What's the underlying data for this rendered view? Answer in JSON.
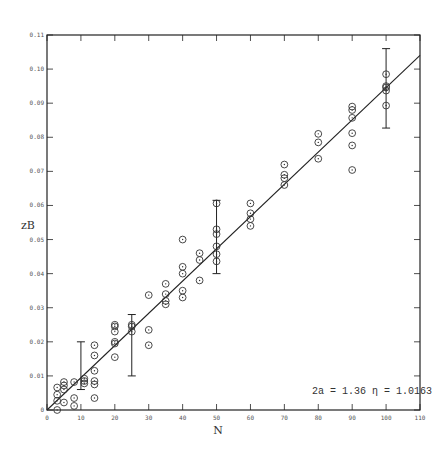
{
  "chart_data": {
    "type": "scatter",
    "title": "",
    "xlabel": "N",
    "ylabel": "zB",
    "xlim": [
      0,
      110
    ],
    "ylim": [
      0,
      0.11
    ],
    "grid": false,
    "xticks": [
      0,
      10,
      20,
      30,
      40,
      50,
      60,
      70,
      80,
      90,
      100,
      110
    ],
    "xtick_labels": [
      "0",
      "10",
      "20",
      "30",
      "40",
      "50",
      "60",
      "70",
      "80",
      "90",
      "100",
      "110"
    ],
    "yticks": [
      0,
      0.01,
      0.02,
      0.03,
      0.04,
      0.05,
      0.06,
      0.07,
      0.08,
      0.09,
      0.1,
      0.11
    ],
    "ytick_labels": [
      "0",
      "0.01",
      "0.02",
      "0.03",
      "0.04",
      "0.05",
      "0.06",
      "0.07",
      "0.08",
      "0.09",
      "0.10",
      "0.11"
    ],
    "annotation": "2a = 1.36    η = 1.0163",
    "series": [
      {
        "name": "measurements",
        "marker": "circle-dot",
        "points": [
          [
            3,
            0.0066
          ],
          [
            3,
            0.0045
          ],
          [
            3,
            0.0027
          ],
          [
            3,
            0.0
          ],
          [
            5,
            0.0082
          ],
          [
            5,
            0.0072
          ],
          [
            5,
            0.006
          ],
          [
            5,
            0.0022
          ],
          [
            8,
            0.0082
          ],
          [
            8,
            0.0035
          ],
          [
            8,
            0.0012
          ],
          [
            11,
            0.0092
          ],
          [
            11,
            0.0085
          ],
          [
            11,
            0.0078
          ],
          [
            14,
            0.019
          ],
          [
            14,
            0.016
          ],
          [
            14,
            0.0115
          ],
          [
            14,
            0.0085
          ],
          [
            14,
            0.0075
          ],
          [
            14,
            0.0035
          ],
          [
            20,
            0.025
          ],
          [
            20,
            0.0245
          ],
          [
            20,
            0.023
          ],
          [
            20,
            0.02
          ],
          [
            20,
            0.0195
          ],
          [
            20,
            0.0155
          ],
          [
            25,
            0.025
          ],
          [
            25,
            0.0245
          ],
          [
            25,
            0.023
          ],
          [
            30,
            0.0337
          ],
          [
            30,
            0.0235
          ],
          [
            30,
            0.019
          ],
          [
            35,
            0.037
          ],
          [
            35,
            0.034
          ],
          [
            35,
            0.032
          ],
          [
            35,
            0.031
          ],
          [
            40,
            0.05
          ],
          [
            40,
            0.042
          ],
          [
            40,
            0.04
          ],
          [
            40,
            0.035
          ],
          [
            40,
            0.033
          ],
          [
            45,
            0.046
          ],
          [
            45,
            0.044
          ],
          [
            45,
            0.038
          ],
          [
            50,
            0.0606
          ],
          [
            50,
            0.053
          ],
          [
            50,
            0.0516
          ],
          [
            50,
            0.048
          ],
          [
            50,
            0.0457
          ],
          [
            50,
            0.0436
          ],
          [
            60,
            0.0606
          ],
          [
            60,
            0.0577
          ],
          [
            60,
            0.056
          ],
          [
            60,
            0.054
          ],
          [
            70,
            0.072
          ],
          [
            70,
            0.069
          ],
          [
            70,
            0.068
          ],
          [
            70,
            0.066
          ],
          [
            80,
            0.081
          ],
          [
            80,
            0.0785
          ],
          [
            80,
            0.0737
          ],
          [
            90,
            0.089
          ],
          [
            90,
            0.088
          ],
          [
            90,
            0.0857
          ],
          [
            90,
            0.0812
          ],
          [
            90,
            0.0776
          ],
          [
            90,
            0.0704
          ],
          [
            100,
            0.0985
          ],
          [
            100,
            0.095
          ],
          [
            100,
            0.0946
          ],
          [
            100,
            0.0937
          ],
          [
            100,
            0.0893
          ]
        ]
      },
      {
        "name": "fit",
        "type": "line",
        "x": [
          0,
          110
        ],
        "y": [
          0,
          0.104
        ]
      }
    ],
    "error_bars": [
      {
        "x": 10,
        "low": 0.006,
        "high": 0.02
      },
      {
        "x": 25,
        "low": 0.01,
        "high": 0.028
      },
      {
        "x": 50,
        "low": 0.04,
        "high": 0.0615
      },
      {
        "x": 100,
        "low": 0.0827,
        "high": 0.106
      }
    ]
  },
  "layout": {
    "plot_left": 47,
    "plot_right": 420,
    "plot_top": 35,
    "plot_bottom": 410,
    "line_color": "#222222",
    "marker_color": "#333333"
  }
}
